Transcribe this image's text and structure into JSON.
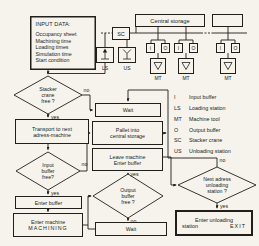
{
  "colors": {
    "ink": "#211e1b",
    "paper": "#f5f3ec"
  },
  "top": {
    "central_storage": "Central storage",
    "sc": "SC",
    "ls": "LS",
    "us": "US",
    "i": "I",
    "o": "O",
    "mt": "MT"
  },
  "input_data": {
    "title": "INPUT DATA:",
    "items": [
      "Occupancy sheet",
      "Machining time",
      "Loading times",
      "Simulation time",
      "Start condition"
    ]
  },
  "decisions": {
    "stacker": {
      "l1": "Stacker",
      "l2": "crane",
      "l3": "free ?"
    },
    "input_buffer": {
      "l1": "Input",
      "l2": "buffer",
      "l3": "free?"
    },
    "output_buffer": {
      "l1": "Output",
      "l2": "buffer",
      "l3": "free ?"
    },
    "next_adress": {
      "l1": "Next adress",
      "l2": "unloading",
      "l3": "station ?"
    }
  },
  "processes": {
    "transport": {
      "l1": "Transport to next",
      "l2": "adress-machine"
    },
    "wait1": "Wait",
    "pallet": {
      "l1": "Pallet into",
      "l2": "central storage"
    },
    "leave": {
      "l1": "Leave machine",
      "l2": "Enter buffer"
    },
    "enter_buffer": "Enter buffer",
    "enter_machine": {
      "l1": "Enter machine",
      "l2": "MACHINING"
    },
    "wait2": "Wait",
    "exit": {
      "l1": "Enter unloading",
      "l2a": "station",
      "l2b": "EXIT"
    }
  },
  "labels": {
    "yes": "yes",
    "no": "no"
  },
  "legend": {
    "rows": [
      {
        "abbr": "I",
        "desc": "Input buffer"
      },
      {
        "abbr": "LS",
        "desc": "Loading station"
      },
      {
        "abbr": "MT",
        "desc": "Machine tool"
      },
      {
        "abbr": "O",
        "desc": "Output buffer"
      },
      {
        "abbr": "SC",
        "desc": "Stacker crane"
      },
      {
        "abbr": "US",
        "desc": "Unloading station"
      }
    ]
  }
}
